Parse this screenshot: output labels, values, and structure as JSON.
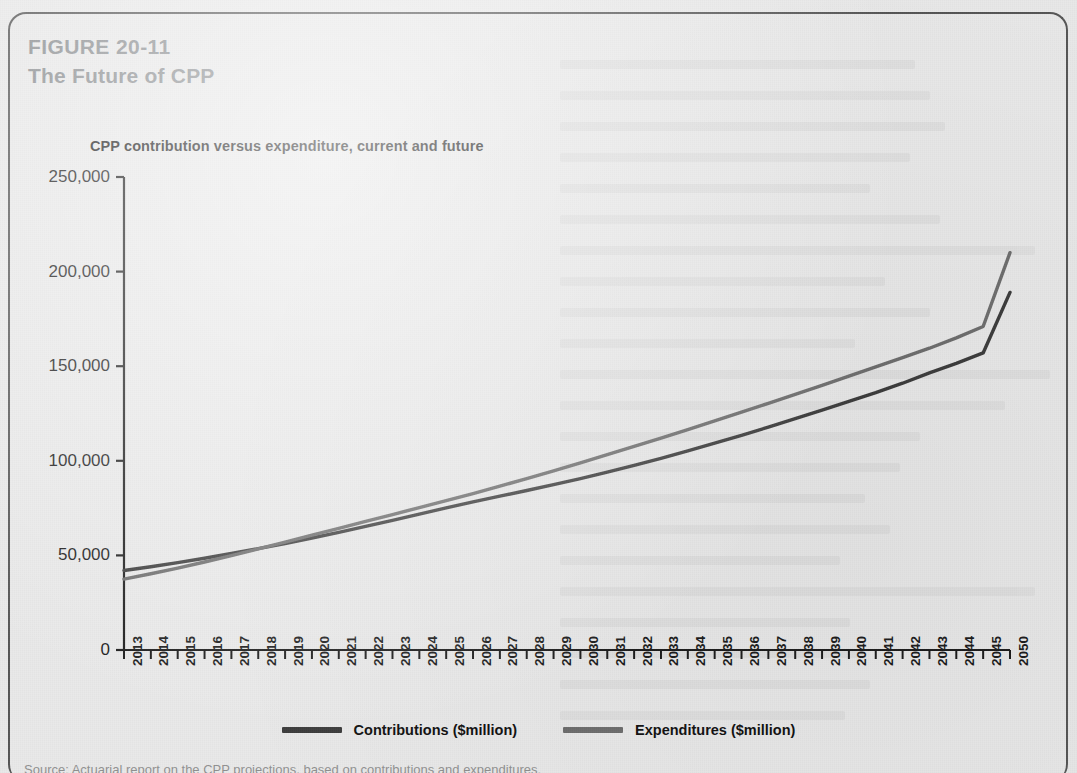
{
  "figure": {
    "number": "FIGURE 20-11",
    "title": "The Future of CPP"
  },
  "colors": {
    "page_background": "#e9e9e9",
    "frame_border": "#555555",
    "figure_heading": "#8a8d90",
    "axis": "#1b1b1b",
    "contributions_line": "#3c3c3c",
    "expenditures_line": "#6d6d6d"
  },
  "legend": {
    "position": "bottom-center",
    "items": [
      {
        "label": "Contributions ($million)",
        "color": "#3c3c3c",
        "swatch": "line-swatch"
      },
      {
        "label": "Expenditures ($million)",
        "color": "#6d6d6d",
        "swatch": "line-swatch"
      }
    ]
  },
  "footnote": "Source: Actuarial report on the CPP projections, based on contributions and expenditures.",
  "chart_data": {
    "type": "line",
    "title": "CPP contribution versus expenditure, current and future",
    "xlabel": "",
    "ylabel": "",
    "grid": false,
    "legend_position": "bottom-center",
    "ylim": [
      0,
      250000
    ],
    "yticks": [
      0,
      50000,
      100000,
      150000,
      200000,
      250000
    ],
    "ytick_labels": [
      "0",
      "50,000",
      "100,000",
      "150,000",
      "200,000",
      "250,000"
    ],
    "categories": [
      "2013",
      "2014",
      "2015",
      "2016",
      "2017",
      "2018",
      "2019",
      "2020",
      "2021",
      "2022",
      "2023",
      "2024",
      "2025",
      "2026",
      "2027",
      "2028",
      "2029",
      "2030",
      "2031",
      "2032",
      "2033",
      "2034",
      "2035",
      "2036",
      "2037",
      "2038",
      "2039",
      "2040",
      "2041",
      "2042",
      "2043",
      "2044",
      "2045",
      "2050"
    ],
    "series": [
      {
        "name": "Contributions ($million)",
        "color": "#3c3c3c",
        "values": [
          42000,
          44000,
          46200,
          48500,
          51000,
          53600,
          56300,
          59200,
          62200,
          65300,
          68500,
          71800,
          75100,
          78300,
          81300,
          84300,
          87400,
          90600,
          94000,
          97600,
          101300,
          105200,
          109300,
          113500,
          117800,
          122300,
          126800,
          131400,
          136000,
          141000,
          146500,
          151500,
          157000,
          189000
        ]
      },
      {
        "name": "Expenditures ($million)",
        "color": "#6d6d6d",
        "values": [
          37500,
          40300,
          43300,
          46500,
          49900,
          53400,
          57000,
          60700,
          64300,
          68000,
          71600,
          75300,
          79000,
          82700,
          86600,
          90600,
          94700,
          98900,
          103200,
          107600,
          112000,
          116500,
          121100,
          125700,
          130400,
          135100,
          139900,
          144700,
          149600,
          154500,
          159500,
          165000,
          171000,
          210000
        ]
      }
    ],
    "annotations": [
      {
        "text": "lines cross near 2026 when expenditures begin to exceed contributions"
      }
    ]
  }
}
